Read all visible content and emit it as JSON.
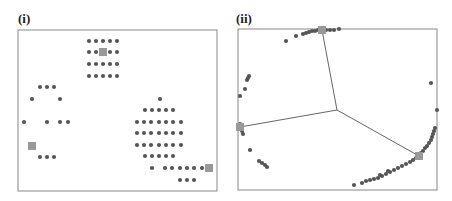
{
  "figure": {
    "panels": [
      {
        "label": "(i)"
      },
      {
        "label": "(ii)"
      }
    ],
    "colors": {
      "dot": "#555555",
      "center_marker": "#999999",
      "frame": "#888888",
      "spoke": "#555555"
    }
  },
  "chart_data": [
    {
      "type": "scatter",
      "title": "(i)",
      "description": "Points in the original space forming three clusters; grey squares mark cluster centers",
      "frame": {
        "x": 18,
        "y": 30,
        "w": 199,
        "h": 161
      },
      "points": [
        [
          89,
          41
        ],
        [
          96,
          41
        ],
        [
          103,
          41
        ],
        [
          110,
          41
        ],
        [
          117,
          41
        ],
        [
          89,
          52
        ],
        [
          96,
          52
        ],
        [
          110,
          52
        ],
        [
          117,
          52
        ],
        [
          89,
          64
        ],
        [
          96,
          64
        ],
        [
          103,
          64
        ],
        [
          110,
          64
        ],
        [
          117,
          64
        ],
        [
          89,
          76
        ],
        [
          96,
          76
        ],
        [
          103,
          76
        ],
        [
          110,
          76
        ],
        [
          117,
          76
        ],
        [
          40,
          87
        ],
        [
          47,
          87
        ],
        [
          54,
          87
        ],
        [
          32,
          99
        ],
        [
          60,
          99
        ],
        [
          24,
          122
        ],
        [
          47,
          122
        ],
        [
          60,
          122
        ],
        [
          68,
          122
        ],
        [
          40,
          157
        ],
        [
          47,
          157
        ],
        [
          54,
          157
        ],
        [
          160,
          99
        ],
        [
          145,
          110
        ],
        [
          152,
          110
        ],
        [
          159,
          110
        ],
        [
          166,
          110
        ],
        [
          173,
          110
        ],
        [
          137,
          122
        ],
        [
          144,
          122
        ],
        [
          151,
          122
        ],
        [
          159,
          122
        ],
        [
          166,
          122
        ],
        [
          173,
          122
        ],
        [
          181,
          122
        ],
        [
          137,
          133
        ],
        [
          144,
          133
        ],
        [
          151,
          133
        ],
        [
          159,
          133
        ],
        [
          166,
          133
        ],
        [
          173,
          133
        ],
        [
          181,
          133
        ],
        [
          137,
          145
        ],
        [
          144,
          145
        ],
        [
          151,
          145
        ],
        [
          159,
          145
        ],
        [
          166,
          145
        ],
        [
          173,
          145
        ],
        [
          181,
          145
        ],
        [
          145,
          156
        ],
        [
          152,
          156
        ],
        [
          159,
          156
        ],
        [
          166,
          156
        ],
        [
          173,
          156
        ],
        [
          152,
          168
        ],
        [
          165,
          168
        ],
        [
          172,
          168
        ],
        [
          180,
          168
        ],
        [
          187,
          168
        ],
        [
          194,
          168
        ],
        [
          202,
          168
        ],
        [
          180,
          180
        ],
        [
          187,
          180
        ],
        [
          194,
          180
        ]
      ],
      "centers": [
        [
          103,
          52
        ],
        [
          32,
          146
        ],
        [
          209,
          168
        ]
      ]
    },
    {
      "type": "scatter",
      "title": "(ii)",
      "description": "Embedded points lying near a circle, with three spokes from a central point to the cluster centers (grey squares)",
      "frame": {
        "x": 238,
        "y": 29,
        "w": 199,
        "h": 161
      },
      "hub": [
        337,
        110
      ],
      "centers": [
        [
          322,
          30
        ],
        [
          240,
          127
        ],
        [
          419,
          156
        ]
      ],
      "points": [
        [
          286,
          41
        ],
        [
          296,
          36
        ],
        [
          303,
          34
        ],
        [
          306,
          33
        ],
        [
          309,
          32
        ],
        [
          312,
          31
        ],
        [
          315,
          31
        ],
        [
          318,
          30
        ],
        [
          326,
          30
        ],
        [
          330,
          30
        ],
        [
          334,
          30
        ],
        [
          339,
          29
        ],
        [
          247,
          80
        ],
        [
          248,
          78
        ],
        [
          249,
          76
        ],
        [
          245,
          89
        ],
        [
          240,
          96
        ],
        [
          240,
          124
        ],
        [
          241,
          129
        ],
        [
          242,
          131
        ],
        [
          243,
          134
        ],
        [
          250,
          150
        ],
        [
          259,
          161
        ],
        [
          262,
          163
        ],
        [
          265,
          165
        ],
        [
          267,
          167
        ],
        [
          431,
          83
        ],
        [
          437,
          110
        ],
        [
          435,
          128
        ],
        [
          434,
          131
        ],
        [
          433,
          134
        ],
        [
          432,
          137
        ],
        [
          431,
          140
        ],
        [
          429,
          143
        ],
        [
          427,
          146
        ],
        [
          425,
          148
        ],
        [
          423,
          151
        ],
        [
          421,
          153
        ],
        [
          416,
          158
        ],
        [
          413,
          160
        ],
        [
          410,
          162
        ],
        [
          406,
          164
        ],
        [
          402,
          166
        ],
        [
          398,
          168
        ],
        [
          394,
          170
        ],
        [
          390,
          172
        ],
        [
          386,
          174
        ],
        [
          382,
          176
        ],
        [
          378,
          178
        ],
        [
          374,
          179
        ],
        [
          370,
          180
        ],
        [
          366,
          181
        ],
        [
          362,
          183
        ],
        [
          388,
          171
        ],
        [
          380,
          175
        ],
        [
          354,
          185
        ]
      ]
    }
  ]
}
